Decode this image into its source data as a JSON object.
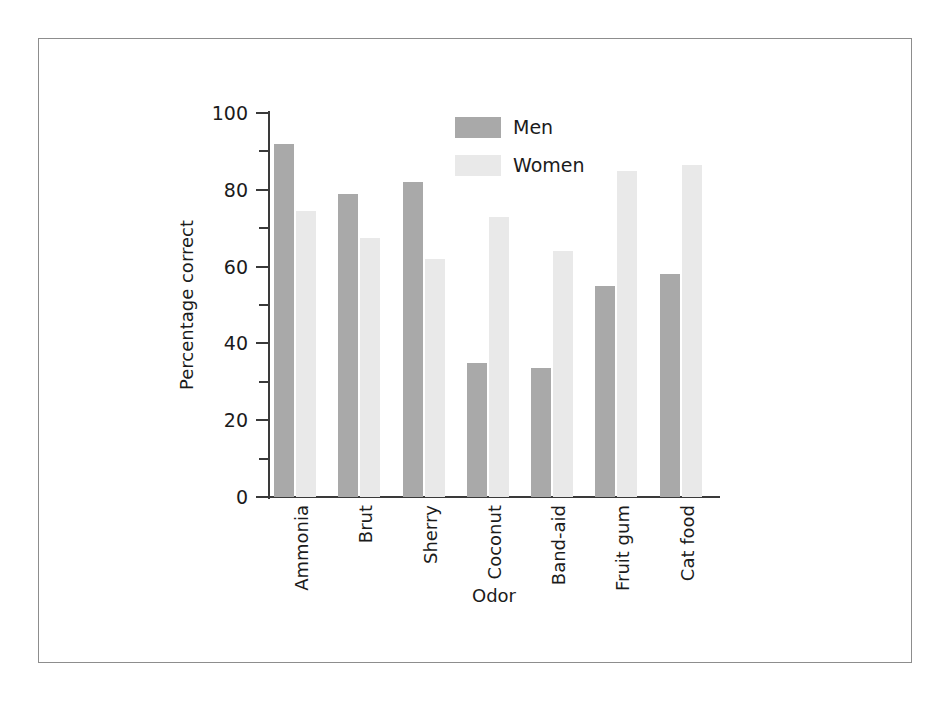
{
  "chart_data": {
    "type": "bar",
    "title": "",
    "xlabel": "Odor",
    "ylabel": "Percentage correct",
    "categories": [
      "Ammonia",
      "Brut",
      "Sherry",
      "Coconut",
      "Band-aid",
      "Fruit gum",
      "Cat food"
    ],
    "series": [
      {
        "name": "Men",
        "color": "#a9a9a9",
        "values": [
          92,
          79,
          82,
          35,
          33.5,
          55,
          58
        ]
      },
      {
        "name": "Women",
        "color": "#e9e9e9",
        "values": [
          74.5,
          67.5,
          62,
          73,
          64,
          85,
          86.5
        ]
      }
    ],
    "ylim": [
      0,
      100
    ],
    "y_major_ticks": [
      0,
      20,
      40,
      60,
      80,
      100
    ],
    "y_minor_ticks": [
      10,
      30,
      50,
      70,
      90
    ],
    "y_tick_labels": [
      "0",
      "20",
      "40",
      "60",
      "80",
      "100"
    ],
    "grid": false,
    "legend_position": "top-center",
    "legend_entries": [
      "Men",
      "Women"
    ],
    "axis_color": "#3a3a3a",
    "frame_color": "#8d8d8d",
    "background": "#ffffff"
  }
}
